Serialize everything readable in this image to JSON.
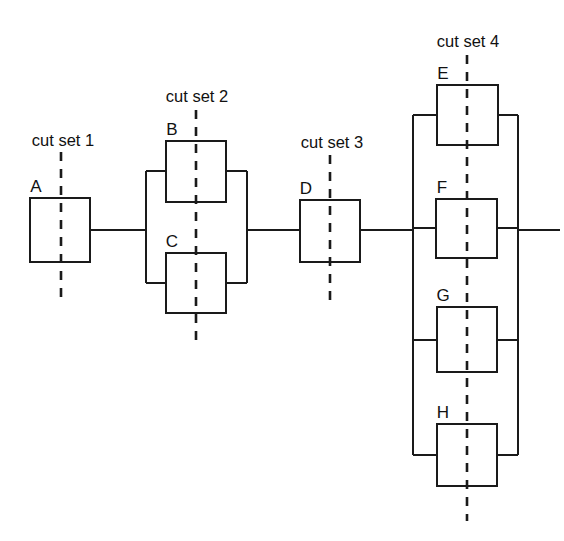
{
  "diagram": {
    "type": "reliability-block-diagram",
    "title": "",
    "canvas": {
      "width": 564,
      "height": 541
    },
    "colors": {
      "background": "#ffffff",
      "stroke": "#1a1a1a",
      "block_fill": "#ffffff",
      "text": "#111111"
    },
    "blocks": [
      {
        "id": "A",
        "label": "A",
        "x": 30,
        "y": 198,
        "w": 60,
        "h": 64,
        "label_x": 36,
        "label_y": 192
      },
      {
        "id": "B",
        "label": "B",
        "x": 166,
        "y": 141,
        "w": 60,
        "h": 61,
        "label_x": 172,
        "label_y": 135
      },
      {
        "id": "C",
        "label": "C",
        "x": 166,
        "y": 253,
        "w": 60,
        "h": 60,
        "label_x": 172,
        "label_y": 247
      },
      {
        "id": "D",
        "label": "D",
        "x": 300,
        "y": 200,
        "w": 60,
        "h": 62,
        "label_x": 306,
        "label_y": 194
      },
      {
        "id": "E",
        "label": "E",
        "x": 437,
        "y": 85,
        "w": 61,
        "h": 60,
        "label_x": 443,
        "label_y": 79
      },
      {
        "id": "F",
        "label": "F",
        "x": 436,
        "y": 199,
        "w": 61,
        "h": 59,
        "label_x": 442,
        "label_y": 193
      },
      {
        "id": "G",
        "label": "G",
        "x": 437,
        "y": 307,
        "w": 60,
        "h": 65,
        "label_x": 443,
        "label_y": 301
      },
      {
        "id": "H",
        "label": "H",
        "x": 437,
        "y": 424,
        "w": 60,
        "h": 62,
        "label_x": 443,
        "label_y": 418
      }
    ],
    "cut_sets": [
      {
        "id": "cut-set-1",
        "label": "cut set 1",
        "x": 61,
        "y_top": 152,
        "y_bottom": 300,
        "label_x": 63,
        "label_y": 146,
        "crosses": [
          "A"
        ]
      },
      {
        "id": "cut-set-2",
        "label": "cut set 2",
        "x": 196,
        "y_top": 110,
        "y_bottom": 345,
        "label_x": 197,
        "label_y": 102,
        "crosses": [
          "B",
          "C"
        ]
      },
      {
        "id": "cut-set-3",
        "label": "cut set 3",
        "x": 330,
        "y_top": 155,
        "y_bottom": 300,
        "label_x": 332,
        "label_y": 148,
        "crosses": [
          "D"
        ]
      },
      {
        "id": "cut-set-4",
        "label": "cut set 4",
        "x": 467,
        "y_top": 55,
        "y_bottom": 521,
        "label_x": 468,
        "label_y": 47,
        "crosses": [
          "E",
          "F",
          "G",
          "H"
        ]
      }
    ],
    "bus_bars": [
      {
        "id": "bus-left-bc",
        "x": 146,
        "y_top": 171,
        "y_bottom": 283
      },
      {
        "id": "bus-right-bc",
        "x": 247,
        "y_top": 171,
        "y_bottom": 283
      },
      {
        "id": "bus-left-efgh",
        "x": 413,
        "y_top": 115,
        "y_bottom": 455
      },
      {
        "id": "bus-right-efgh",
        "x": 518,
        "y_top": 115,
        "y_bottom": 455
      }
    ],
    "wires": [
      {
        "id": "wire-a-out",
        "points": "90,230 146,230"
      },
      {
        "id": "wire-bc-out",
        "points": "247,230 300,230"
      },
      {
        "id": "wire-d-out",
        "points": "360,230 413,230"
      },
      {
        "id": "wire-efgh-out",
        "points": "518,230 560,230"
      },
      {
        "id": "stub-b-left",
        "points": "146,171 166,171"
      },
      {
        "id": "stub-b-right",
        "points": "226,171 247,171"
      },
      {
        "id": "stub-c-left",
        "points": "146,283 166,283"
      },
      {
        "id": "stub-c-right",
        "points": "226,283 247,283"
      },
      {
        "id": "stub-e-left",
        "points": "413,115 437,115"
      },
      {
        "id": "stub-e-right",
        "points": "498,115 518,115"
      },
      {
        "id": "stub-f-left",
        "points": "413,228 436,228"
      },
      {
        "id": "stub-f-right",
        "points": "497,228 518,228"
      },
      {
        "id": "stub-g-left",
        "points": "413,340 437,340"
      },
      {
        "id": "stub-g-right",
        "points": "497,340 518,340"
      },
      {
        "id": "stub-h-left",
        "points": "413,455 437,455"
      },
      {
        "id": "stub-h-right",
        "points": "497,455 518,455"
      }
    ],
    "topology": {
      "description": "A in series with parallel(B, C), in series with D, in series with parallel(E, F, G, H)",
      "series_path": [
        "A",
        "parallel(B,C)",
        "D",
        "parallel(E,F,G,H)"
      ]
    }
  }
}
